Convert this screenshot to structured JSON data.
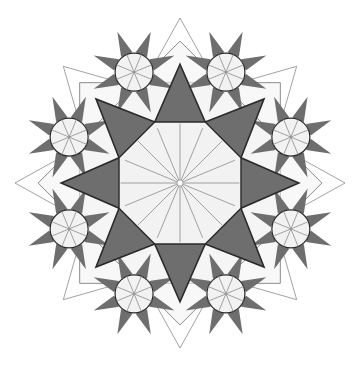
{
  "diagram": {
    "title": "",
    "type": "geometric-star-pattern",
    "center": [
      180,
      183
    ],
    "outer_radius": 165,
    "central_star_points": 8,
    "satellite_count": 8,
    "satellite_radius": 120,
    "satellite_circle_radius": 19,
    "satellite_star_points": 8,
    "center_rosette_spokes": 16,
    "colors": {
      "fill_dark": "#6e6e6e",
      "fill_light": "#f2f2f2",
      "line_dark": "#2a2a2a",
      "line_light": "#8c8c8c",
      "background": "#ffffff"
    }
  }
}
